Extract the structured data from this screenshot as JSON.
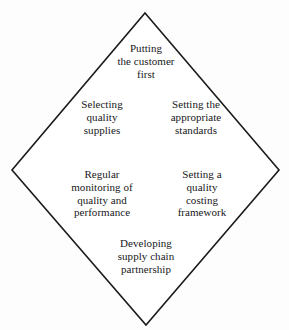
{
  "diagram": {
    "shape": "diamond",
    "stroke_color": "#1a1a1a",
    "fill_color": "#ffffff",
    "background_color": "#fdfdfd",
    "text_color": "#17171a",
    "vertices": {
      "top": [
        145,
        13
      ],
      "left": [
        12,
        170
      ],
      "right": [
        279,
        170
      ],
      "bottom": [
        146,
        325
      ]
    },
    "labels": {
      "top": "Putting\nthe customer\nfirst",
      "upper_left": "Selecting\nquality\nsupplies",
      "upper_right": "Setting the\nappropriate\nstandards",
      "lower_left": "Regular\nmonitoring of\nquality and\nperformance",
      "lower_right": "Setting a\nquality\ncosting\nframework",
      "bottom": "Developing\nsupply chain\npartnership"
    }
  }
}
